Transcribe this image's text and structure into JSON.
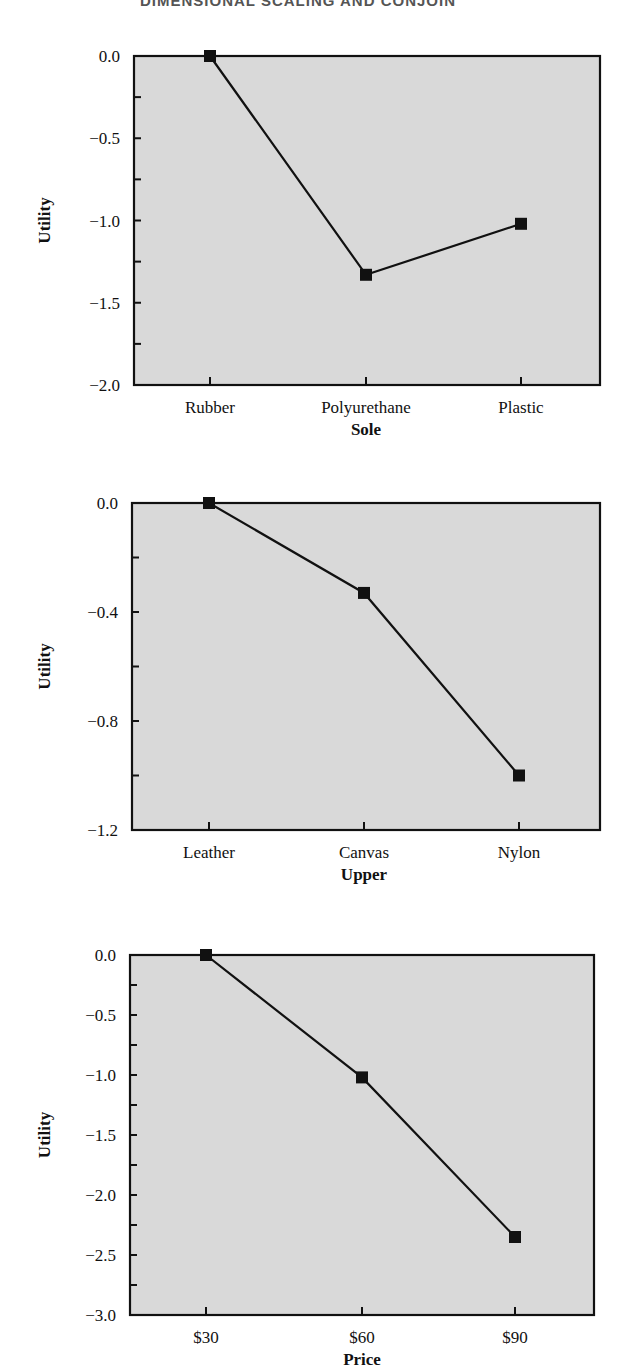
{
  "page": {
    "running_header": "DIMENSIONAL SCALING AND CONJOIN"
  },
  "colors": {
    "plot_fill": "#d9d9d9",
    "line": "#111111",
    "marker": "#111111",
    "axis": "#111111"
  },
  "chart_data": [
    {
      "type": "line",
      "title": "",
      "xlabel": "Sole",
      "ylabel": "Utility",
      "categories": [
        "Rubber",
        "Polyurethane",
        "Plastic"
      ],
      "values": [
        0.0,
        -1.33,
        -1.02
      ],
      "ylim": [
        -2.0,
        0.0
      ],
      "yticks_major": [
        0.0,
        -0.5,
        -1.0,
        -1.5,
        -2.0
      ],
      "ytick_labels": [
        "0.0",
        "−0.5",
        "−1.0",
        "−1.5",
        "−2.0"
      ],
      "yticks_minor_step": 0.25,
      "grid": false,
      "marker": "square",
      "legend": null
    },
    {
      "type": "line",
      "title": "",
      "xlabel": "Upper",
      "ylabel": "Utility",
      "categories": [
        "Leather",
        "Canvas",
        "Nylon"
      ],
      "values": [
        0.0,
        -0.33,
        -1.0
      ],
      "ylim": [
        -1.2,
        0.0
      ],
      "yticks_major": [
        0.0,
        -0.4,
        -0.8,
        -1.2
      ],
      "ytick_labels": [
        "0.0",
        "−0.4",
        "−0.8",
        "−1.2"
      ],
      "yticks_minor_step": 0.2,
      "grid": false,
      "marker": "square",
      "legend": null
    },
    {
      "type": "line",
      "title": "",
      "xlabel": "Price",
      "ylabel": "Utility",
      "categories": [
        "$30",
        "$60",
        "$90"
      ],
      "values": [
        0.0,
        -1.02,
        -2.35
      ],
      "ylim": [
        -3.0,
        0.0
      ],
      "yticks_major": [
        0.0,
        -0.5,
        -1.0,
        -1.5,
        -2.0,
        -2.5,
        -3.0
      ],
      "ytick_labels": [
        "0.0",
        "−0.5",
        "−1.0",
        "−1.5",
        "−2.0",
        "−2.5",
        "−3.0"
      ],
      "yticks_minor_step": 0.25,
      "grid": false,
      "marker": "square",
      "legend": null
    }
  ],
  "layout": {
    "panels": [
      {
        "top": 0,
        "plot": {
          "x0": 134,
          "x1": 600,
          "y0": 56,
          "y1": 385
        },
        "cat_x": [
          210,
          366,
          521
        ]
      },
      {
        "top": 0,
        "plot": {
          "x0": 132,
          "x1": 600,
          "y0": 503,
          "y1": 830
        },
        "cat_x": [
          209,
          364,
          519
        ]
      },
      {
        "top": 0,
        "plot": {
          "x0": 130,
          "x1": 594,
          "y0": 955,
          "y1": 1315
        },
        "cat_x": [
          206,
          362,
          515
        ]
      }
    ]
  }
}
